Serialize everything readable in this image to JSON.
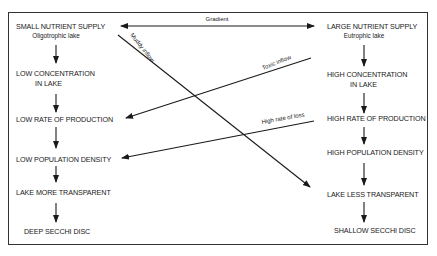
{
  "diagram": {
    "gradient_label": "Gradient",
    "left_column": {
      "nodes": [
        {
          "label": "SMALL NUTRIENT SUPPLY",
          "sublabel": "Oligotrophic lake"
        },
        {
          "label": "LOW CONCENTRATION",
          "label2": "IN LAKE"
        },
        {
          "label": "LOW RATE OF PRODUCTION"
        },
        {
          "label": "LOW POPULATION DENSITY"
        },
        {
          "label": "LAKE MORE TRANSPARENT"
        },
        {
          "label": "DEEP SECCHI DISC"
        }
      ]
    },
    "right_column": {
      "nodes": [
        {
          "label": "LARGE NUTRIENT SUPPLY",
          "sublabel": "Eutrophic lake"
        },
        {
          "label": "HIGH CONCENTRATION",
          "label2": "IN LAKE"
        },
        {
          "label": "HIGH RATE OF PRODUCTION"
        },
        {
          "label": "HIGH POPULATION DENSITY"
        },
        {
          "label": "LAKE LESS TRANSPARENT"
        },
        {
          "label": "SHALLOW SECCHI DISC"
        }
      ]
    },
    "cross_edges": [
      {
        "label": "Muddy inflow",
        "from": "SMALL NUTRIENT SUPPLY",
        "to": "LAKE LESS TRANSPARENT"
      },
      {
        "label": "Toxic inflow",
        "from": "LARGE NUTRIENT SUPPLY",
        "to": "LOW RATE OF PRODUCTION"
      },
      {
        "label": "High rate of loss",
        "from": "HIGH RATE OF PRODUCTION",
        "to": "LOW POPULATION DENSITY"
      }
    ]
  }
}
